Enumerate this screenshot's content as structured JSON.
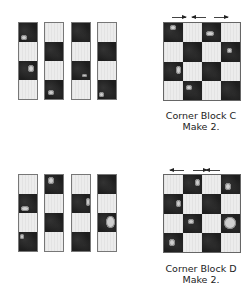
{
  "figure_c": {
    "strips": [
      [
        "dark",
        "light",
        "dark",
        "light"
      ],
      [
        "light",
        "dark",
        "light",
        "dark"
      ],
      [
        "dark",
        "light",
        "dark",
        "light"
      ],
      [
        "light",
        "dark",
        "light",
        "dark"
      ]
    ],
    "block_rows": [
      [
        "dark",
        "light",
        "dark",
        "light"
      ],
      [
        "light",
        "dark",
        "light",
        "dark"
      ],
      [
        "dark",
        "light",
        "dark",
        "light"
      ],
      [
        "light",
        "dark",
        "light",
        "dark"
      ]
    ],
    "pressing_arrows": [
      "right",
      "left",
      "right"
    ],
    "caption_title": "Corner Block C",
    "caption_qty": "Make 2."
  },
  "figure_d": {
    "strips": [
      [
        "light",
        "dark",
        "light",
        "dark"
      ],
      [
        "dark",
        "light",
        "dark",
        "light"
      ],
      [
        "light",
        "dark",
        "light",
        "dark"
      ],
      [
        "dark",
        "light",
        "dark",
        "light"
      ]
    ],
    "block_rows": [
      [
        "light",
        "dark",
        "light",
        "dark"
      ],
      [
        "dark",
        "light",
        "dark",
        "light"
      ],
      [
        "light",
        "dark",
        "light",
        "dark"
      ],
      [
        "dark",
        "light",
        "dark",
        "light"
      ]
    ],
    "pressing_arrows": [
      "left",
      "right",
      "left"
    ],
    "caption_title": "Corner Block D",
    "caption_qty": "Make 2."
  },
  "colors": {
    "dark_fabric": "#1e1e1e",
    "light_fabric": "#ececec",
    "outline": "#777777"
  }
}
